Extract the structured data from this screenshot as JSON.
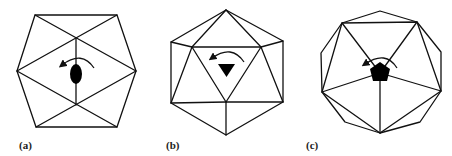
{
  "figure": {
    "panels": [
      {
        "id": "a",
        "label": "(a)",
        "symmetry_marker": "ellipse",
        "rotation_direction": "counterclockwise"
      },
      {
        "id": "b",
        "label": "(b)",
        "symmetry_marker": "triangle",
        "rotation_direction": "counterclockwise"
      },
      {
        "id": "c",
        "label": "(c)",
        "symmetry_marker": "pentagon",
        "rotation_direction": "counterclockwise"
      }
    ],
    "colors": {
      "line": "#111111",
      "marker": "#000000",
      "background": "#ffffff"
    }
  }
}
